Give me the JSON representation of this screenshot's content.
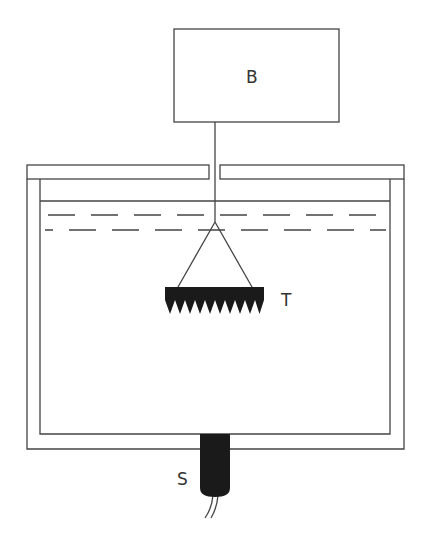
{
  "diagram": {
    "labels": {
      "box": "B",
      "tool": "T",
      "sensor": "S"
    },
    "colors": {
      "line": "#444444",
      "fill_dark": "#1a1a1a",
      "background": "#ffffff"
    }
  }
}
